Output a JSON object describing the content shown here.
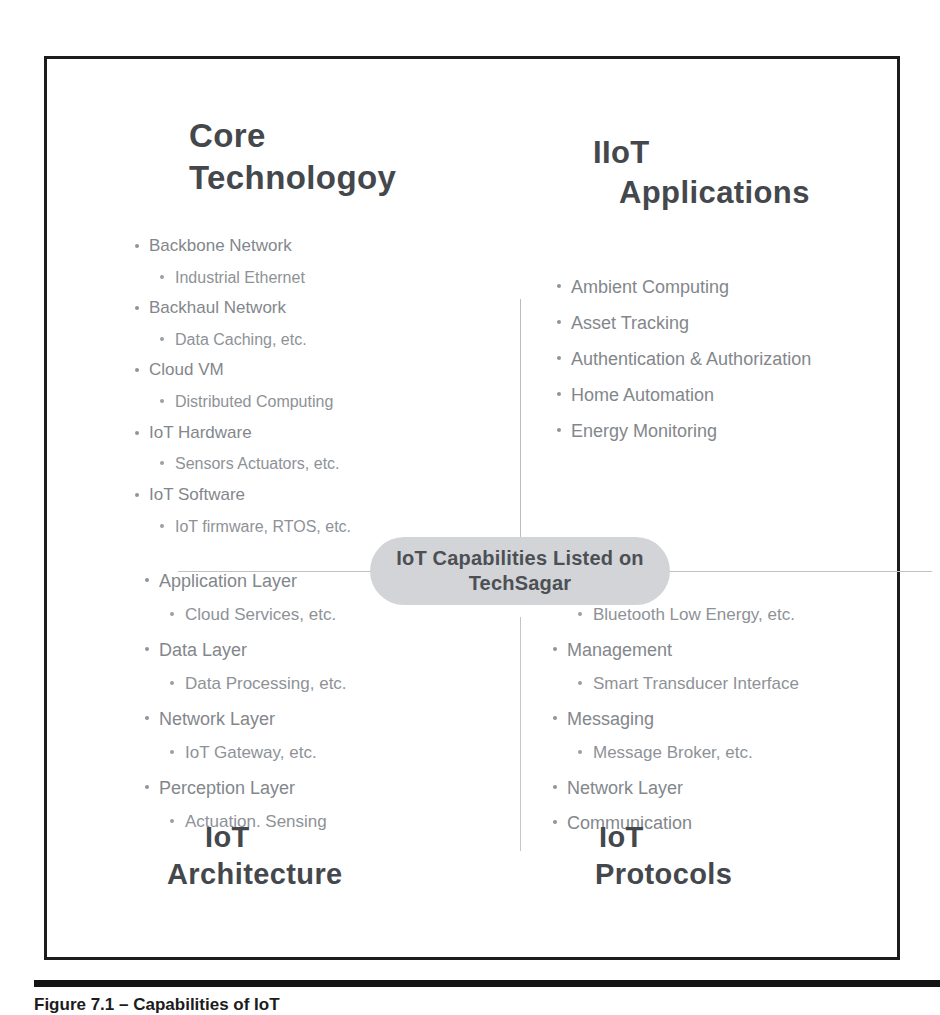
{
  "figure": {
    "center_badge": {
      "line1": "IoT Capabilities Listed on",
      "line2": "TechSagar"
    },
    "quadrants": {
      "core_technology": {
        "heading_line1": "Core",
        "heading_line2": "Technologoy",
        "items": [
          {
            "level": 1,
            "text": "Backbone Network"
          },
          {
            "level": 2,
            "text": "Industrial Ethernet"
          },
          {
            "level": 1,
            "text": "Backhaul Network"
          },
          {
            "level": 2,
            "text": "Data Caching, etc."
          },
          {
            "level": 1,
            "text": "Cloud VM"
          },
          {
            "level": 2,
            "text": "Distributed Computing"
          },
          {
            "level": 1,
            "text": "IoT Hardware"
          },
          {
            "level": 2,
            "text": "Sensors Actuators, etc."
          },
          {
            "level": 1,
            "text": "IoT Software"
          },
          {
            "level": 2,
            "text": "IoT firmware, RTOS, etc."
          }
        ]
      },
      "iiot_applications": {
        "heading_line1": "IIoT",
        "heading_line2": "Applications",
        "items": [
          {
            "level": 1,
            "text": "Ambient Computing"
          },
          {
            "level": 1,
            "text": "Asset Tracking"
          },
          {
            "level": 1,
            "text": "Authentication & Authorization"
          },
          {
            "level": 1,
            "text": "Home Automation"
          },
          {
            "level": 1,
            "text": "Energy Monitoring"
          }
        ]
      },
      "iot_architecture": {
        "heading_line1": "IoT",
        "heading_line2": "Architecture",
        "items": [
          {
            "level": 1,
            "text": "Application Layer"
          },
          {
            "level": 2,
            "text": "Cloud Services, etc."
          },
          {
            "level": 1,
            "text": "Data Layer"
          },
          {
            "level": 2,
            "text": "Data Processing, etc."
          },
          {
            "level": 1,
            "text": "Network Layer"
          },
          {
            "level": 2,
            "text": "IoT Gateway, etc."
          },
          {
            "level": 1,
            "text": "Perception Layer"
          },
          {
            "level": 2,
            "text": "Actuation. Sensing"
          }
        ]
      },
      "iot_protocols": {
        "heading_line1": "IoT",
        "heading_line2": "Protocols",
        "items": [
          {
            "level": 1,
            "text": "Data Link"
          },
          {
            "level": 2,
            "text": "Bluetooth Low Energy, etc."
          },
          {
            "level": 1,
            "text": "Management"
          },
          {
            "level": 2,
            "text": "Smart Transducer Interface"
          },
          {
            "level": 1,
            "text": "Messaging"
          },
          {
            "level": 2,
            "text": "Message Broker, etc."
          },
          {
            "level": 1,
            "text": "Network Layer"
          },
          {
            "level": 1,
            "text": "Communication"
          }
        ]
      }
    }
  },
  "caption": {
    "text": "Figure 7.1 – Capabilities of IoT"
  },
  "colors": {
    "frame_border": "#1c1c1c",
    "heading_text": "#44484d",
    "bullet_text": "#83878c",
    "badge_background": "#d2d4d7",
    "badge_text": "#4c5055",
    "divider": "#bfc2c6",
    "caption_rule": "#141414"
  }
}
